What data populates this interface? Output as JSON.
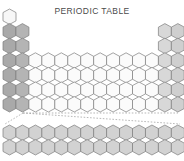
{
  "title": "PERIODIC TABLE",
  "colors": {
    "background": "#ffffff",
    "title_text": "#4a4a4a",
    "cell_stroke": "#7d7d7d",
    "connector": "#9a9a9a",
    "group1": "#a9a9a9",
    "group2": "#b4b4b4",
    "hydrogen": "#f7f7f7",
    "transition": "#fbfbfb",
    "group13": "#d8d8d8",
    "group14": "#cfcfcf",
    "group15": "#c6c6c6",
    "group16": "#bdbdbd",
    "group17": "#1a1a1a",
    "group18": "#a0a0a0",
    "fblock": "#d2d2d2"
  },
  "geometry": {
    "hex_width": 13.0,
    "hex_height": 15.4,
    "col_pitch": 12.95,
    "row_pitch": 14.6,
    "main_origin_x": 3.0,
    "main_origin_y": 9.0,
    "fblock_origin_x": 3.0,
    "fblock_origin_y": 125.0
  },
  "main_table": {
    "rows": 7,
    "columns": 18,
    "cells": [
      {
        "row": 1,
        "col": 1,
        "fill_key": "hydrogen"
      },
      {
        "row": 1,
        "col": 18,
        "fill_key": "group18"
      },
      {
        "row": 2,
        "col": 1,
        "fill_key": "group1"
      },
      {
        "row": 2,
        "col": 2,
        "fill_key": "group2"
      },
      {
        "row": 2,
        "col": 13,
        "fill_key": "group13"
      },
      {
        "row": 2,
        "col": 14,
        "fill_key": "group14"
      },
      {
        "row": 2,
        "col": 15,
        "fill_key": "group15"
      },
      {
        "row": 2,
        "col": 16,
        "fill_key": "group16"
      },
      {
        "row": 2,
        "col": 17,
        "fill_key": "group17"
      },
      {
        "row": 2,
        "col": 18,
        "fill_key": "group18"
      },
      {
        "row": 3,
        "col": 1,
        "fill_key": "group1"
      },
      {
        "row": 3,
        "col": 2,
        "fill_key": "group2"
      },
      {
        "row": 3,
        "col": 13,
        "fill_key": "group13"
      },
      {
        "row": 3,
        "col": 14,
        "fill_key": "group14"
      },
      {
        "row": 3,
        "col": 15,
        "fill_key": "group15"
      },
      {
        "row": 3,
        "col": 16,
        "fill_key": "group16"
      },
      {
        "row": 3,
        "col": 17,
        "fill_key": "group17"
      },
      {
        "row": 3,
        "col": 18,
        "fill_key": "group18"
      },
      {
        "row": 4,
        "col": 1,
        "fill_key": "group1"
      },
      {
        "row": 4,
        "col": 2,
        "fill_key": "group2"
      },
      {
        "row": 4,
        "col": 3,
        "fill_key": "transition"
      },
      {
        "row": 4,
        "col": 4,
        "fill_key": "transition"
      },
      {
        "row": 4,
        "col": 5,
        "fill_key": "transition"
      },
      {
        "row": 4,
        "col": 6,
        "fill_key": "transition"
      },
      {
        "row": 4,
        "col": 7,
        "fill_key": "transition"
      },
      {
        "row": 4,
        "col": 8,
        "fill_key": "transition"
      },
      {
        "row": 4,
        "col": 9,
        "fill_key": "transition"
      },
      {
        "row": 4,
        "col": 10,
        "fill_key": "transition"
      },
      {
        "row": 4,
        "col": 11,
        "fill_key": "transition"
      },
      {
        "row": 4,
        "col": 12,
        "fill_key": "transition"
      },
      {
        "row": 4,
        "col": 13,
        "fill_key": "group13"
      },
      {
        "row": 4,
        "col": 14,
        "fill_key": "group14"
      },
      {
        "row": 4,
        "col": 15,
        "fill_key": "group15"
      },
      {
        "row": 4,
        "col": 16,
        "fill_key": "group16"
      },
      {
        "row": 4,
        "col": 17,
        "fill_key": "group17"
      },
      {
        "row": 4,
        "col": 18,
        "fill_key": "group18"
      },
      {
        "row": 5,
        "col": 1,
        "fill_key": "group1"
      },
      {
        "row": 5,
        "col": 2,
        "fill_key": "group2"
      },
      {
        "row": 5,
        "col": 3,
        "fill_key": "transition"
      },
      {
        "row": 5,
        "col": 4,
        "fill_key": "transition"
      },
      {
        "row": 5,
        "col": 5,
        "fill_key": "transition"
      },
      {
        "row": 5,
        "col": 6,
        "fill_key": "transition"
      },
      {
        "row": 5,
        "col": 7,
        "fill_key": "transition"
      },
      {
        "row": 5,
        "col": 8,
        "fill_key": "transition"
      },
      {
        "row": 5,
        "col": 9,
        "fill_key": "transition"
      },
      {
        "row": 5,
        "col": 10,
        "fill_key": "transition"
      },
      {
        "row": 5,
        "col": 11,
        "fill_key": "transition"
      },
      {
        "row": 5,
        "col": 12,
        "fill_key": "transition"
      },
      {
        "row": 5,
        "col": 13,
        "fill_key": "group13"
      },
      {
        "row": 5,
        "col": 14,
        "fill_key": "group14"
      },
      {
        "row": 5,
        "col": 15,
        "fill_key": "group15"
      },
      {
        "row": 5,
        "col": 16,
        "fill_key": "group16"
      },
      {
        "row": 5,
        "col": 17,
        "fill_key": "group17"
      },
      {
        "row": 5,
        "col": 18,
        "fill_key": "group18"
      },
      {
        "row": 6,
        "col": 1,
        "fill_key": "group1"
      },
      {
        "row": 6,
        "col": 2,
        "fill_key": "group2"
      },
      {
        "row": 6,
        "col": 3,
        "fill_key": "transition"
      },
      {
        "row": 6,
        "col": 4,
        "fill_key": "transition"
      },
      {
        "row": 6,
        "col": 5,
        "fill_key": "transition"
      },
      {
        "row": 6,
        "col": 6,
        "fill_key": "transition"
      },
      {
        "row": 6,
        "col": 7,
        "fill_key": "transition"
      },
      {
        "row": 6,
        "col": 8,
        "fill_key": "transition"
      },
      {
        "row": 6,
        "col": 9,
        "fill_key": "transition"
      },
      {
        "row": 6,
        "col": 10,
        "fill_key": "transition"
      },
      {
        "row": 6,
        "col": 11,
        "fill_key": "transition"
      },
      {
        "row": 6,
        "col": 12,
        "fill_key": "transition"
      },
      {
        "row": 6,
        "col": 13,
        "fill_key": "group13"
      },
      {
        "row": 6,
        "col": 14,
        "fill_key": "group14"
      },
      {
        "row": 6,
        "col": 15,
        "fill_key": "group15"
      },
      {
        "row": 6,
        "col": 16,
        "fill_key": "group16"
      },
      {
        "row": 6,
        "col": 17,
        "fill_key": "group17"
      },
      {
        "row": 6,
        "col": 18,
        "fill_key": "group18"
      },
      {
        "row": 7,
        "col": 1,
        "fill_key": "group1"
      },
      {
        "row": 7,
        "col": 2,
        "fill_key": "group2"
      },
      {
        "row": 7,
        "col": 3,
        "fill_key": "transition"
      },
      {
        "row": 7,
        "col": 4,
        "fill_key": "transition"
      },
      {
        "row": 7,
        "col": 5,
        "fill_key": "transition"
      },
      {
        "row": 7,
        "col": 6,
        "fill_key": "transition"
      },
      {
        "row": 7,
        "col": 7,
        "fill_key": "transition"
      },
      {
        "row": 7,
        "col": 8,
        "fill_key": "transition"
      },
      {
        "row": 7,
        "col": 9,
        "fill_key": "transition"
      },
      {
        "row": 7,
        "col": 10,
        "fill_key": "transition"
      },
      {
        "row": 7,
        "col": 11,
        "fill_key": "transition"
      },
      {
        "row": 7,
        "col": 12,
        "fill_key": "transition"
      },
      {
        "row": 7,
        "col": 13,
        "fill_key": "group13"
      },
      {
        "row": 7,
        "col": 14,
        "fill_key": "group14"
      },
      {
        "row": 7,
        "col": 15,
        "fill_key": "group15"
      },
      {
        "row": 7,
        "col": 16,
        "fill_key": "group16"
      }
    ]
  },
  "f_block": {
    "rows": 2,
    "columns": 14,
    "fill_key": "fblock",
    "row_labels": [
      "lanthanide-row",
      "actinide-row"
    ]
  },
  "connectors": [
    {
      "name": "lanthanide-connector-left",
      "x1": 23,
      "y1": 113,
      "x2": 5,
      "y2": 124
    },
    {
      "name": "lanthanide-connector-right",
      "x1": 23,
      "y1": 113,
      "x2": 180,
      "y2": 124
    },
    {
      "name": "lanthanide-connector-span",
      "x1": 23,
      "y1": 113,
      "x2": 178,
      "y2": 113
    }
  ]
}
